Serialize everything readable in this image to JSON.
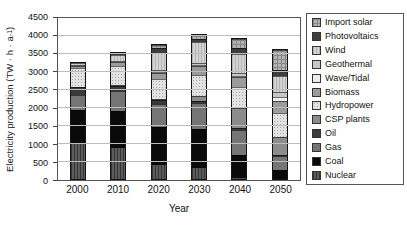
{
  "figure": {
    "background": "#ffffff"
  },
  "chart_data": {
    "type": "bar",
    "subtype": "stacked",
    "title": "",
    "xlabel": "Year",
    "ylabel": "Electricity production (TW · h · a⁻¹)",
    "ylabel_prefix": "Electricity production (TW · h · a",
    "ylabel_sup": "-1",
    "ylabel_suffix": ")",
    "categories": [
      "2000",
      "2010",
      "2020",
      "2030",
      "2040",
      "2050"
    ],
    "ylim": [
      0,
      4500
    ],
    "ytick_step": 500,
    "yticks": [
      0,
      500,
      1000,
      1500,
      2000,
      2500,
      3000,
      3500,
      4000,
      4500
    ],
    "grid": true,
    "legend_position": "right",
    "units": "TW·h·a⁻¹",
    "totals": [
      3290,
      3545,
      3780,
      4050,
      3950,
      3630
    ],
    "series": [
      {
        "name": "Import solar",
        "values": [
          0,
          0,
          100,
          100,
          260,
          540
        ],
        "color": "#b3b3b3",
        "color2": "#878787",
        "pattern": "grid"
      },
      {
        "name": "Photovoltaics",
        "values": [
          0,
          60,
          120,
          100,
          170,
          180
        ],
        "color": "#3d3d3d",
        "color2": "#3d3d3d",
        "pattern": "solid"
      },
      {
        "name": "Wind",
        "values": [
          65,
          150,
          500,
          570,
          520,
          460
        ],
        "color": "#d2d2d2",
        "color2": "#b5b5b5",
        "pattern": "vstripes"
      },
      {
        "name": "Geothermal",
        "values": [
          5,
          10,
          40,
          70,
          90,
          130
        ],
        "color": "#c6c6c6",
        "color2": "#c6c6c6",
        "pattern": "solid"
      },
      {
        "name": "Wave/Tidal",
        "values": [
          0,
          0,
          10,
          30,
          40,
          120
        ],
        "color": "#ededed",
        "color2": "#ededed",
        "pattern": "solid"
      },
      {
        "name": "Biomass",
        "values": [
          70,
          120,
          180,
          240,
          280,
          330
        ],
        "color": "#9b9b9b",
        "color2": "#9b9b9b",
        "pattern": "solid"
      },
      {
        "name": "Hydropower",
        "values": [
          540,
          550,
          570,
          600,
          600,
          680
        ],
        "color": "#e2e2e2",
        "color2": "#a8a8a8",
        "pattern": "dots"
      },
      {
        "name": "CSP plants",
        "values": [
          0,
          5,
          30,
          150,
          550,
          500
        ],
        "color": "#8c8c8c",
        "color2": "#8c8c8c",
        "pattern": "solid"
      },
      {
        "name": "Oil",
        "values": [
          210,
          150,
          100,
          40,
          60,
          30
        ],
        "color": "#3a3a3a",
        "color2": "#3a3a3a",
        "pattern": "solid"
      },
      {
        "name": "Gas",
        "values": [
          450,
          550,
          650,
          750,
          700,
          410
        ],
        "color": "#757575",
        "color2": "#757575",
        "pattern": "solid"
      },
      {
        "name": "Coal",
        "values": [
          950,
          1050,
          1080,
          1100,
          650,
          250
        ],
        "color": "#0a0a0a",
        "color2": "#0a0a0a",
        "pattern": "solid"
      },
      {
        "name": "Nuclear",
        "values": [
          1000,
          900,
          400,
          300,
          30,
          0
        ],
        "color": "#5c5c5c",
        "color2": "#353535",
        "pattern": "vstripes"
      }
    ]
  }
}
